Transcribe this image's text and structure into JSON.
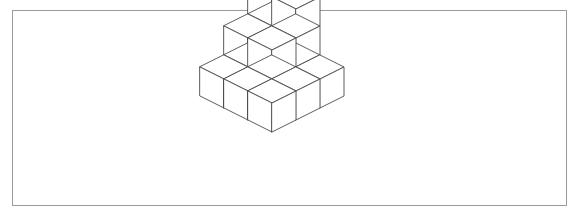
{
  "figure": {
    "frame": {
      "x": 12,
      "y": 10,
      "width": 555,
      "height": 196,
      "border_color": "#9a9a9a",
      "border_width": 1,
      "background_color": "#ffffff"
    },
    "style": {
      "line_color": "#4a4a4a",
      "line_width": 0.9,
      "face_fill": "#ffffff"
    },
    "projection": {
      "type": "isometric",
      "half_width": 24,
      "half_depth": 12,
      "cube_height": 29,
      "origin_x": 272,
      "origin_y": 31
    },
    "cubes": [
      {
        "gx": 0,
        "gy": 0,
        "gz": 2
      },
      {
        "gx": 1,
        "gy": 0,
        "gz": 2
      },
      {
        "gx": 0,
        "gy": 0,
        "gz": 1
      },
      {
        "gx": 1,
        "gy": 0,
        "gz": 1
      },
      {
        "gx": 0,
        "gy": 1,
        "gz": 1
      },
      {
        "gx": 1,
        "gy": 1,
        "gz": 1
      },
      {
        "gx": 0,
        "gy": 0,
        "gz": 0
      },
      {
        "gx": 1,
        "gy": 0,
        "gz": 0
      },
      {
        "gx": 2,
        "gy": 0,
        "gz": 0
      },
      {
        "gx": 0,
        "gy": 1,
        "gz": 0
      },
      {
        "gx": 1,
        "gy": 1,
        "gz": 0
      },
      {
        "gx": 2,
        "gy": 1,
        "gz": 0
      },
      {
        "gx": 0,
        "gy": 2,
        "gz": 0
      },
      {
        "gx": 1,
        "gy": 2,
        "gz": 0
      },
      {
        "gx": 2,
        "gy": 2,
        "gz": 0
      }
    ],
    "cube_count": 15,
    "levels": 3
  }
}
